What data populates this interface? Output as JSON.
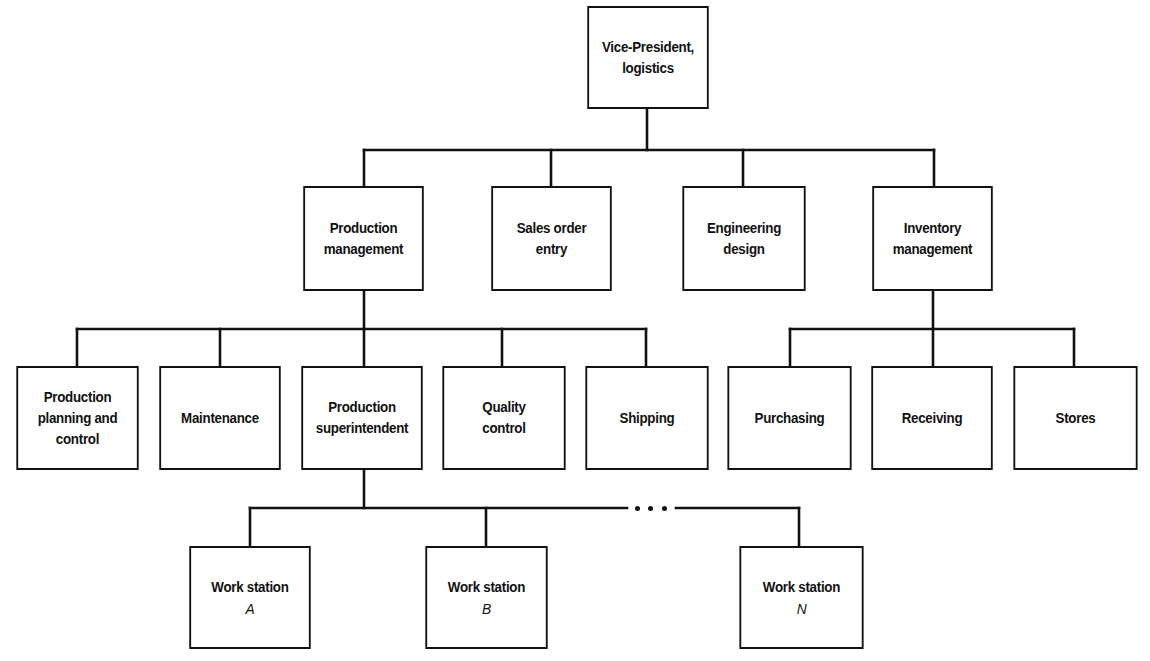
{
  "diagram": {
    "type": "organization-chart",
    "colors": {
      "line": "#111111",
      "box_fill": "#ffffff",
      "background": "#ffffff"
    },
    "root": {
      "id": "vp",
      "lines": [
        "Vice-President,",
        "logistics"
      ]
    },
    "level1": [
      {
        "id": "production_management",
        "lines": [
          "Production",
          "management"
        ]
      },
      {
        "id": "sales_order_entry",
        "lines": [
          "Sales order",
          "entry"
        ]
      },
      {
        "id": "engineering_design",
        "lines": [
          "Engineering",
          "design"
        ]
      },
      {
        "id": "inventory_management",
        "lines": [
          "Inventory",
          "management"
        ]
      }
    ],
    "production_children": [
      {
        "id": "production_planning",
        "lines": [
          "Production",
          "planning and",
          "control"
        ]
      },
      {
        "id": "maintenance",
        "lines": [
          "Maintenance"
        ]
      },
      {
        "id": "production_superintendent",
        "lines": [
          "Production",
          "superintendent"
        ]
      },
      {
        "id": "quality_control",
        "lines": [
          "Quality",
          "control"
        ]
      },
      {
        "id": "shipping",
        "lines": [
          "Shipping"
        ]
      }
    ],
    "inventory_children": [
      {
        "id": "purchasing",
        "lines": [
          "Purchasing"
        ]
      },
      {
        "id": "receiving",
        "lines": [
          "Receiving"
        ]
      },
      {
        "id": "stores",
        "lines": [
          "Stores"
        ]
      }
    ],
    "superintendent_children": [
      {
        "id": "work_station_a",
        "lines": [
          "Work station",
          "A"
        ]
      },
      {
        "id": "work_station_b",
        "lines": [
          "Work station",
          "B"
        ]
      },
      {
        "id": "work_station_n",
        "lines": [
          "Work station",
          "N"
        ]
      }
    ],
    "ellipsis": "…"
  }
}
